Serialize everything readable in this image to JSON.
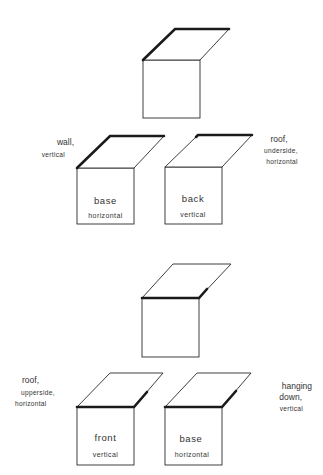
{
  "diagram": {
    "stroke_color": "#2a2a2a",
    "background": "#ffffff",
    "section_1": {
      "ambiguous_figure": {
        "thick_edges": [
          "left-slant",
          "top"
        ]
      },
      "interpretations": [
        {
          "square_label": "base",
          "square_sublabel": "horizontal",
          "flap_label_line1": "wall,",
          "flap_label_line2": "vertical"
        },
        {
          "square_label": "back",
          "square_sublabel": "vertical",
          "flap_label_line1": "roof,",
          "flap_label_line2": "underside,",
          "flap_label_line3": "horizontal"
        }
      ]
    },
    "section_2": {
      "ambiguous_figure": {
        "thick_edges": [
          "bottom",
          "right-slant"
        ]
      },
      "interpretations": [
        {
          "square_label": "front",
          "square_sublabel": "vertical",
          "flap_label_line1": "roof,",
          "flap_label_line2": "upperside,",
          "flap_label_line3": "horizontal"
        },
        {
          "square_label": "base",
          "square_sublabel": "horizontal",
          "flap_label_line1": "hanging",
          "flap_label_line2": "down,",
          "flap_label_line3": "vertical"
        }
      ]
    }
  }
}
